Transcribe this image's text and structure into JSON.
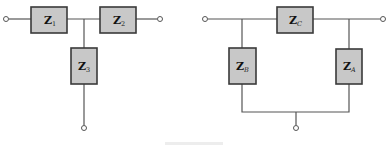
{
  "diagram": {
    "type": "circuit-schematic",
    "networks": [
      {
        "name": "T-network",
        "impedances": [
          {
            "id": "Z1",
            "label": "Z",
            "subscript": "1",
            "position": "series-left"
          },
          {
            "id": "Z2",
            "label": "Z",
            "subscript": "2",
            "position": "series-right"
          },
          {
            "id": "Z3",
            "label": "Z",
            "subscript": "3",
            "position": "shunt"
          }
        ],
        "terminals": 3
      },
      {
        "name": "Pi-network",
        "impedances": [
          {
            "id": "ZC",
            "label": "Z",
            "subscript": "C",
            "position": "series"
          },
          {
            "id": "ZB",
            "label": "Z",
            "subscript": "B",
            "position": "shunt-left"
          },
          {
            "id": "ZA",
            "label": "Z",
            "subscript": "A",
            "position": "shunt-right"
          }
        ],
        "terminals": 3
      }
    ],
    "colors": {
      "box_fill": "#c8c8c8",
      "box_stroke": "#3a3a3a",
      "wire": "#555555"
    }
  }
}
